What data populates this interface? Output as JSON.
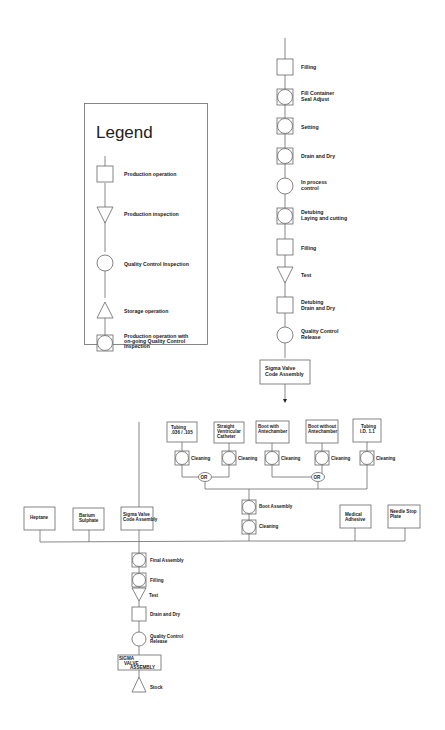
{
  "legend": {
    "title": "Legend",
    "items": [
      {
        "symbol": "square",
        "label": [
          "Production operation"
        ]
      },
      {
        "symbol": "triangle-down",
        "label": [
          "Production inspection"
        ]
      },
      {
        "symbol": "circle",
        "label": [
          "Quality Control Inspection"
        ]
      },
      {
        "symbol": "triangle-up",
        "label": [
          "Storage operation"
        ]
      },
      {
        "symbol": "square-circle",
        "label": [
          "Production operation with",
          "on-going Quality Control",
          "Inspection"
        ]
      }
    ]
  },
  "upper_chain": {
    "steps": [
      {
        "symbol": "square",
        "label": [
          "Filling"
        ]
      },
      {
        "symbol": "square-circle",
        "label": [
          "Fill Container",
          "Seal Adjust"
        ]
      },
      {
        "symbol": "square-circle",
        "label": [
          "Setting"
        ]
      },
      {
        "symbol": "square-circle",
        "label": [
          "Drain and Dry"
        ]
      },
      {
        "symbol": "circle",
        "label": [
          "In process",
          "control"
        ]
      },
      {
        "symbol": "square-circle",
        "label": [
          "Detubing",
          "Laying and cutting"
        ]
      },
      {
        "symbol": "square",
        "label": [
          "Filling"
        ]
      },
      {
        "symbol": "triangle-down",
        "label": [
          "Test"
        ]
      },
      {
        "symbol": "square",
        "label": [
          "Detubing",
          "Drain and Dry"
        ]
      },
      {
        "symbol": "circle",
        "label": [
          "Quality Control",
          "Release"
        ]
      }
    ],
    "output_box": [
      "Sigma Valve",
      "Code Assembly"
    ]
  },
  "boot_section": {
    "components": [
      {
        "box": [
          "Tubing",
          ".036 / .105"
        ],
        "step": "Cleaning"
      },
      {
        "box": [
          "Straight",
          "Ventricular",
          "Catheter"
        ],
        "step": "Cleaning"
      },
      {
        "box": [
          "Boot with",
          "Antechamber"
        ],
        "step": "Cleaning"
      },
      {
        "box": [
          "Boot without",
          "Antechamber"
        ],
        "step": "Cleaning"
      },
      {
        "box": [
          "Tubing",
          "I.D. 1.1"
        ],
        "step": "Cleaning"
      }
    ],
    "or_labels": [
      "OR",
      "OR"
    ],
    "steps": [
      {
        "symbol": "square-circle",
        "label": "Boot Assembly"
      },
      {
        "symbol": "square-circle",
        "label": "Cleaning"
      }
    ]
  },
  "inputs": [
    {
      "label": [
        "Heptane"
      ]
    },
    {
      "label": [
        "Barium",
        "Sulphate"
      ]
    },
    {
      "label": [
        "Sigma Valve",
        "Code Assembly"
      ]
    },
    {
      "label": [
        "Medical",
        "Adhesive"
      ]
    },
    {
      "label": [
        "Needle Stop",
        "Plate"
      ]
    }
  ],
  "final_chain": {
    "steps": [
      {
        "symbol": "square-circle",
        "label": [
          "Final Assembly"
        ]
      },
      {
        "symbol": "square-circle",
        "label": [
          "Filling"
        ]
      },
      {
        "symbol": "triangle-down",
        "label": [
          "Test"
        ]
      },
      {
        "symbol": "square",
        "label": [
          "Drain and Dry"
        ]
      },
      {
        "symbol": "circle",
        "label": [
          "Quality Control",
          "Release"
        ]
      }
    ],
    "product_box": [
      "SIGMA",
      "VALVE",
      "ASSEMBLY"
    ],
    "storage": {
      "symbol": "triangle-up",
      "label": "Stock"
    }
  }
}
